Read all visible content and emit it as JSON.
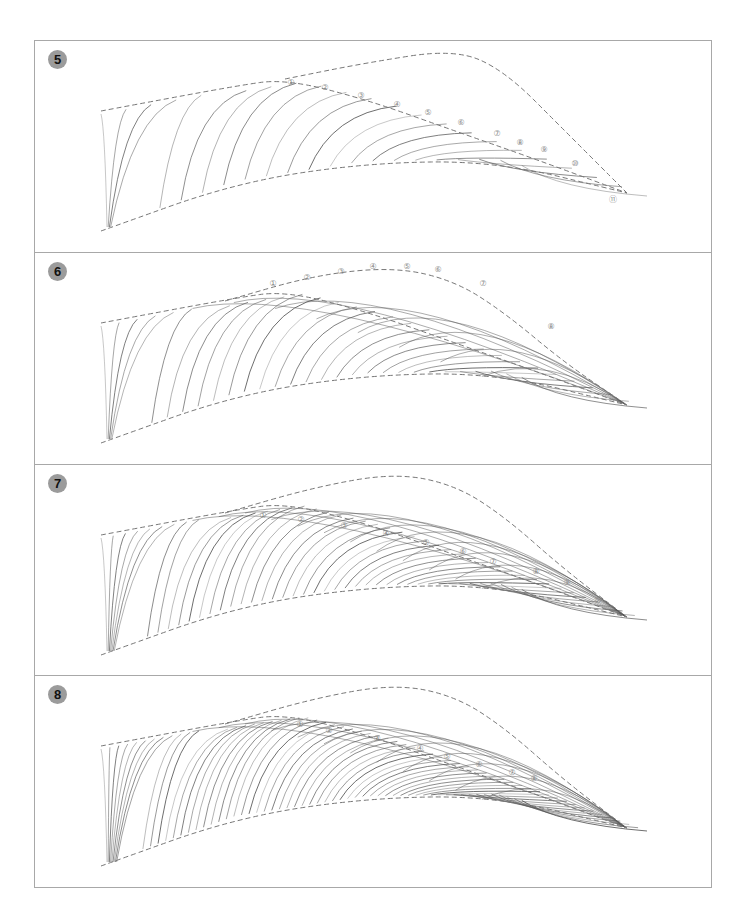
{
  "figure": {
    "colors": {
      "frame": "#a8a8a8",
      "badge": "#9b9b9b",
      "stroke": "#555555",
      "guide": "#777777",
      "label": "#8a8a8a"
    },
    "panels": [
      {
        "step": "5",
        "top": 0,
        "height": 211,
        "guides": {
          "upper": [
            [
              66,
              70
            ],
            [
              200,
              45
            ],
            [
              250,
              38
            ],
            [
              330,
              58
            ],
            [
              420,
              90
            ],
            [
              500,
              118
            ],
            [
              592,
              152
            ]
          ],
          "lower": [
            [
              66,
              190
            ],
            [
              200,
              142
            ],
            [
              330,
              122
            ],
            [
              460,
              120
            ],
            [
              592,
              152
            ]
          ],
          "outer": [
            [
              250,
              38
            ],
            [
              330,
              22
            ],
            [
              420,
              8
            ],
            [
              470,
              30
            ],
            [
              530,
              90
            ],
            [
              592,
              152
            ]
          ]
        },
        "labels": [
          {
            "text": "①",
            "x": 256,
            "y": 44
          },
          {
            "text": "②",
            "x": 290,
            "y": 49
          },
          {
            "text": "③",
            "x": 326,
            "y": 57
          },
          {
            "text": "④",
            "x": 362,
            "y": 66
          },
          {
            "text": "⑤",
            "x": 393,
            "y": 74
          },
          {
            "text": "⑥",
            "x": 426,
            "y": 84
          },
          {
            "text": "⑦",
            "x": 462,
            "y": 95
          },
          {
            "text": "⑧",
            "x": 485,
            "y": 104
          },
          {
            "text": "⑨",
            "x": 509,
            "y": 111
          },
          {
            "text": "⑩",
            "x": 540,
            "y": 125
          },
          {
            "text": "⑪",
            "x": 578,
            "y": 161
          }
        ],
        "strokeCount": 22
      },
      {
        "step": "6",
        "top": 211,
        "height": 212,
        "guides": {
          "upper": [
            [
              66,
              70
            ],
            [
              200,
              45
            ],
            [
              250,
              38
            ],
            [
              330,
              58
            ],
            [
              420,
              90
            ],
            [
              500,
              118
            ],
            [
              592,
              152
            ]
          ],
          "lower": [
            [
              66,
              190
            ],
            [
              200,
              142
            ],
            [
              330,
              122
            ],
            [
              460,
              120
            ],
            [
              592,
              152
            ]
          ],
          "outer": [
            [
              190,
              48
            ],
            [
              280,
              22
            ],
            [
              360,
              14
            ],
            [
              420,
              28
            ],
            [
              470,
              60
            ],
            [
              530,
              110
            ],
            [
              592,
              152
            ]
          ]
        },
        "labels": [
          {
            "text": "①",
            "x": 238,
            "y": 33
          },
          {
            "text": "②",
            "x": 272,
            "y": 27
          },
          {
            "text": "③",
            "x": 306,
            "y": 21
          },
          {
            "text": "④",
            "x": 338,
            "y": 16
          },
          {
            "text": "⑤",
            "x": 372,
            "y": 16
          },
          {
            "text": "⑥",
            "x": 403,
            "y": 19
          },
          {
            "text": "⑦",
            "x": 448,
            "y": 33
          },
          {
            "text": "⑧",
            "x": 516,
            "y": 76
          }
        ],
        "strokeCount": 30
      },
      {
        "step": "7",
        "top": 423,
        "height": 211,
        "guides": {
          "upper": [
            [
              66,
              70
            ],
            [
              200,
              45
            ],
            [
              250,
              38
            ],
            [
              330,
              58
            ],
            [
              420,
              90
            ],
            [
              500,
              118
            ],
            [
              592,
              152
            ]
          ],
          "lower": [
            [
              66,
              190
            ],
            [
              200,
              142
            ],
            [
              330,
              122
            ],
            [
              460,
              120
            ],
            [
              592,
              152
            ]
          ],
          "outer": [
            [
              190,
              48
            ],
            [
              280,
              22
            ],
            [
              360,
              8
            ],
            [
              420,
              20
            ],
            [
              470,
              52
            ],
            [
              530,
              105
            ],
            [
              592,
              152
            ]
          ]
        },
        "labels": [
          {
            "text": "①",
            "x": 228,
            "y": 53
          },
          {
            "text": "②",
            "x": 266,
            "y": 57
          },
          {
            "text": "③",
            "x": 309,
            "y": 63
          },
          {
            "text": "④",
            "x": 351,
            "y": 71
          },
          {
            "text": "⑤",
            "x": 391,
            "y": 80
          },
          {
            "text": "⑥",
            "x": 428,
            "y": 89
          },
          {
            "text": "⑦",
            "x": 458,
            "y": 99
          },
          {
            "text": "⑧",
            "x": 501,
            "y": 109
          },
          {
            "text": "⑨",
            "x": 532,
            "y": 120
          },
          {
            "text": "⑩",
            "x": 563,
            "y": 138
          }
        ],
        "strokeCount": 44
      },
      {
        "step": "8",
        "top": 634,
        "height": 214,
        "guides": {
          "upper": [
            [
              66,
              70
            ],
            [
              200,
              45
            ],
            [
              250,
              38
            ],
            [
              330,
              58
            ],
            [
              420,
              90
            ],
            [
              500,
              118
            ],
            [
              592,
              152
            ]
          ],
          "lower": [
            [
              66,
              190
            ],
            [
              200,
              142
            ],
            [
              330,
              122
            ],
            [
              460,
              120
            ],
            [
              592,
              152
            ]
          ],
          "outer": [
            [
              190,
              48
            ],
            [
              280,
              22
            ],
            [
              360,
              8
            ],
            [
              420,
              20
            ],
            [
              470,
              52
            ],
            [
              530,
              105
            ],
            [
              592,
              152
            ]
          ]
        },
        "labels": [
          {
            "text": "①",
            "x": 265,
            "y": 51
          },
          {
            "text": "②",
            "x": 294,
            "y": 57
          },
          {
            "text": "③",
            "x": 342,
            "y": 65
          },
          {
            "text": "④",
            "x": 385,
            "y": 75
          },
          {
            "text": "⑤",
            "x": 412,
            "y": 83
          },
          {
            "text": "⑥",
            "x": 444,
            "y": 91
          },
          {
            "text": "⑦",
            "x": 477,
            "y": 99
          },
          {
            "text": "⑧",
            "x": 499,
            "y": 105
          }
        ],
        "strokeCount": 60
      }
    ]
  }
}
